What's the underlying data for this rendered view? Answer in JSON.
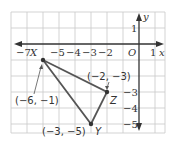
{
  "axes": {
    "x_label": "x",
    "y_label": "y",
    "origin_label": "O",
    "x_ticks": [
      {
        "value": -7,
        "label": "−7"
      },
      {
        "value": -5,
        "label": "−5"
      },
      {
        "value": -4,
        "label": "−4"
      },
      {
        "value": -3,
        "label": "−3"
      },
      {
        "value": -2,
        "label": "−2"
      },
      {
        "value": 1,
        "label": "1"
      }
    ],
    "y_ticks": [
      {
        "value": 1,
        "label": "1"
      },
      {
        "value": -3,
        "label": "−3"
      },
      {
        "value": -4,
        "label": "−4"
      },
      {
        "value": -5,
        "label": "−5"
      }
    ]
  },
  "points": {
    "X": {
      "name": "X",
      "coords": "(−6, −1)",
      "x": -6,
      "y": -1
    },
    "Y": {
      "name": "Y",
      "coords": "(−3, −5)",
      "x": -3,
      "y": -5
    },
    "Z": {
      "name": "Z",
      "coords": "(−2, −3)",
      "x": -2,
      "y": -3
    }
  },
  "colors": {
    "grid": "#c8c8c8",
    "axis": "#333333",
    "triangle": "#555555"
  }
}
